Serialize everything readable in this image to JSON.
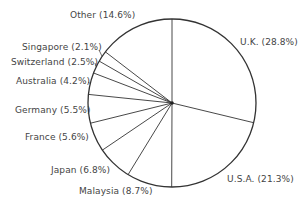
{
  "chart_data": {
    "type": "pie",
    "title": "",
    "start_angle_deg": 0,
    "direction": "clockwise",
    "slices": [
      {
        "label": "U.K.",
        "value": 28.8,
        "text": "U.K. (28.8%)"
      },
      {
        "label": "U.S.A.",
        "value": 21.3,
        "text": "U.S.A. (21.3%)"
      },
      {
        "label": "Malaysia",
        "value": 8.7,
        "text": "Malaysia (8.7%)"
      },
      {
        "label": "Japan",
        "value": 6.8,
        "text": "Japan (6.8%)"
      },
      {
        "label": "France",
        "value": 5.6,
        "text": "France (5.6%)"
      },
      {
        "label": "Germany",
        "value": 5.5,
        "text": "Germany (5.5%)"
      },
      {
        "label": "Australia",
        "value": 4.2,
        "text": "Australia (4.2%)"
      },
      {
        "label": "Switzerland",
        "value": 2.5,
        "text": "Switzerland (2.5%)"
      },
      {
        "label": "Singapore",
        "value": 2.1,
        "text": "Singapore (2.1%)"
      },
      {
        "label": "Other",
        "value": 14.6,
        "text": "Other (14.6%)"
      }
    ],
    "legend": "none (labels placed around pie)"
  },
  "style": {
    "stroke": "#333333",
    "fill": "#ffffff",
    "text": "#444444"
  }
}
